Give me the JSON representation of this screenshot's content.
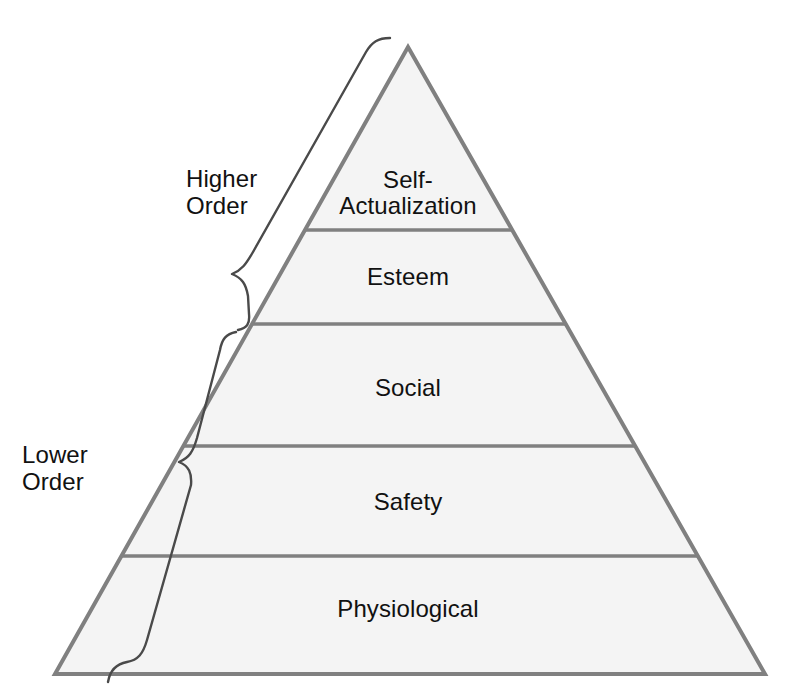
{
  "diagram": {
    "kind": "pyramid-hierarchy",
    "colors": {
      "background": "#ffffff",
      "tier_fill": "#f4f4f4",
      "tier_stroke": "#808080",
      "brace_stroke": "#4a4a4a",
      "text": "#111111"
    },
    "tiers": [
      {
        "id": "self-actualization",
        "label": "Self-\nActualization",
        "level": 5,
        "group": "higher-order"
      },
      {
        "id": "esteem",
        "label": "Esteem",
        "level": 4,
        "group": "higher-order"
      },
      {
        "id": "social",
        "label": "Social",
        "level": 3,
        "group": "lower-order"
      },
      {
        "id": "safety",
        "label": "Safety",
        "level": 2,
        "group": "lower-order"
      },
      {
        "id": "physiological",
        "label": "Physiological",
        "level": 1,
        "group": "lower-order"
      }
    ],
    "groups": [
      {
        "id": "higher-order",
        "label": "Higher\nOrder",
        "covers": [
          "self-actualization",
          "esteem"
        ]
      },
      {
        "id": "lower-order",
        "label": "Lower\nOrder",
        "covers": [
          "social",
          "safety",
          "physiological"
        ]
      }
    ],
    "geometry": {
      "apex": [
        408,
        47
      ],
      "base_left": [
        55,
        674
      ],
      "base_right": [
        765,
        674
      ],
      "divider_y": [
        230,
        324,
        446,
        556
      ]
    }
  }
}
